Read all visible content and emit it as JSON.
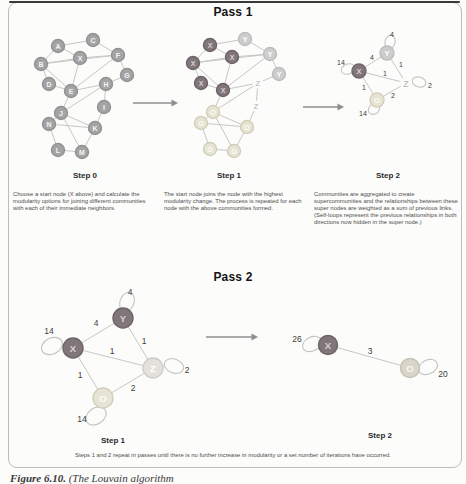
{
  "page": {
    "pass1_title": "Pass 1",
    "pass2_title": "Pass 2",
    "step_labels": {
      "p1s0": "Step 0",
      "p1s1": "Step 1",
      "p1s2": "Step 2",
      "p2s1": "Step 1",
      "p2s2": "Step 2"
    },
    "captions": {
      "step0": "Choose a start node (X above) and calculate the modularity options for joining different communities with each of their immediate neighbors.",
      "step1": "The start node joins the node with the highest modularity change. The process is repeated for each node with the above communities formed.",
      "step2": "Communities are aggregated to create supercommunities and the relationships between these super nodes are weighted as a sum of previous links. (Self-loops represent the previous relationships in both directions now hidden in the super node.)",
      "bottom": "Steps 1 and 2 repeat in passes until there is no further increase in modularity or a set number of iterations have occurred."
    },
    "figure_caption_prefix": "Figure 6.10.",
    "figure_caption_rest": " (The Louvain algorithm"
  },
  "palette": {
    "edge": "#c7c7c7",
    "loop": "#c3c3c3",
    "arrow": "#8f8f8f",
    "weight_text": "#3c3c3c",
    "types": {
      "g": {
        "fill": "#a4a4a4",
        "stroke": "#929292",
        "text": "#f5f5f5"
      },
      "x": {
        "fill": "#81777a",
        "stroke": "#6d6366",
        "text": "#d8d1d3"
      },
      "y": {
        "fill": "#cdcdcd",
        "stroke": "#bdbdbd",
        "text": "#ffffff"
      },
      "o": {
        "fill": "#e6e4d4",
        "stroke": "#d2cfb8",
        "text": "#fdfdf6"
      },
      "zn": {
        "fill": "#e2e1dc",
        "stroke": "#cecdc5",
        "text": "#ffffff"
      },
      "oz": {
        "fill": "#d9d5ca",
        "stroke": "#c5c1b3",
        "text": "#f8f7f1"
      },
      "zt": {
        "circle": false,
        "text": "#b3b3b3"
      }
    }
  },
  "graphs": [
    {
      "id": "pass1-step0",
      "r": 6.5,
      "nfs": 7,
      "lfs": 7,
      "nodes": [
        {
          "id": "A",
          "x": 58,
          "y": 46,
          "t": "g",
          "l": "A"
        },
        {
          "id": "C",
          "x": 93,
          "y": 40,
          "t": "g",
          "l": "C"
        },
        {
          "id": "F",
          "x": 118,
          "y": 55,
          "t": "g",
          "l": "F"
        },
        {
          "id": "B",
          "x": 41,
          "y": 64,
          "t": "g",
          "l": "B"
        },
        {
          "id": "X",
          "x": 80,
          "y": 58,
          "t": "g",
          "l": "X"
        },
        {
          "id": "G",
          "x": 127,
          "y": 75,
          "t": "g",
          "l": "G"
        },
        {
          "id": "D",
          "x": 49,
          "y": 84,
          "t": "g",
          "l": "D"
        },
        {
          "id": "E",
          "x": 71,
          "y": 91,
          "t": "g",
          "l": "E"
        },
        {
          "id": "H",
          "x": 106,
          "y": 84,
          "t": "g",
          "l": "H"
        },
        {
          "id": "I",
          "x": 104,
          "y": 107,
          "t": "g",
          "l": "I"
        },
        {
          "id": "J",
          "x": 61,
          "y": 113,
          "t": "g",
          "l": "J"
        },
        {
          "id": "N",
          "x": 49,
          "y": 124,
          "t": "g",
          "l": "N"
        },
        {
          "id": "K",
          "x": 95,
          "y": 128,
          "t": "g",
          "l": "K"
        },
        {
          "id": "L",
          "x": 58,
          "y": 150,
          "t": "g",
          "l": "L"
        },
        {
          "id": "M",
          "x": 82,
          "y": 152,
          "t": "g",
          "l": "M"
        }
      ],
      "edges": [
        [
          "A",
          "B"
        ],
        [
          "A",
          "X"
        ],
        [
          "A",
          "C"
        ],
        [
          "B",
          "X"
        ],
        [
          "B",
          "D"
        ],
        [
          "B",
          "E"
        ],
        [
          "B",
          "F"
        ],
        [
          "C",
          "F"
        ],
        [
          "D",
          "E"
        ],
        [
          "E",
          "X"
        ],
        [
          "E",
          "F"
        ],
        [
          "E",
          "H"
        ],
        [
          "E",
          "J"
        ],
        [
          "X",
          "F"
        ],
        [
          "F",
          "G"
        ],
        [
          "G",
          "H"
        ],
        [
          "H",
          "I"
        ],
        [
          "H",
          "J"
        ],
        [
          "I",
          "K"
        ],
        [
          "J",
          "K"
        ],
        [
          "J",
          "N"
        ],
        [
          "J",
          "M"
        ],
        [
          "N",
          "K"
        ],
        [
          "N",
          "L"
        ],
        [
          "K",
          "M"
        ],
        [
          "L",
          "M"
        ]
      ],
      "loops": [],
      "labels": []
    },
    {
      "id": "pass1-step1",
      "r": 6.5,
      "nfs": 7,
      "lfs": 7,
      "nodes": [
        {
          "id": "A",
          "x": 210,
          "y": 45,
          "t": "x",
          "l": "X"
        },
        {
          "id": "C",
          "x": 245,
          "y": 39,
          "t": "y",
          "l": "Y"
        },
        {
          "id": "F",
          "x": 270,
          "y": 54,
          "t": "y",
          "l": "Y"
        },
        {
          "id": "B",
          "x": 193,
          "y": 63,
          "t": "x",
          "l": "X"
        },
        {
          "id": "X",
          "x": 232,
          "y": 57,
          "t": "x",
          "l": "X"
        },
        {
          "id": "G",
          "x": 279,
          "y": 74,
          "t": "y",
          "l": "Y"
        },
        {
          "id": "D",
          "x": 201,
          "y": 83,
          "t": "x",
          "l": "X"
        },
        {
          "id": "E",
          "x": 223,
          "y": 90,
          "t": "x",
          "l": "X"
        },
        {
          "id": "H",
          "x": 258,
          "y": 83,
          "t": "zt",
          "l": "Z",
          "fs": 8
        },
        {
          "id": "I",
          "x": 256,
          "y": 106,
          "t": "zt",
          "l": "Z",
          "fs": 8
        },
        {
          "id": "J",
          "x": 213,
          "y": 112,
          "t": "o",
          "l": "O"
        },
        {
          "id": "N",
          "x": 201,
          "y": 123,
          "t": "o",
          "l": "O"
        },
        {
          "id": "K",
          "x": 247,
          "y": 127,
          "t": "o",
          "l": "O"
        },
        {
          "id": "L",
          "x": 210,
          "y": 149,
          "t": "o",
          "l": "O"
        },
        {
          "id": "M",
          "x": 234,
          "y": 151,
          "t": "o",
          "l": "O"
        }
      ],
      "edges": [
        [
          "A",
          "B"
        ],
        [
          "A",
          "X"
        ],
        [
          "A",
          "C"
        ],
        [
          "B",
          "X"
        ],
        [
          "B",
          "D"
        ],
        [
          "B",
          "E"
        ],
        [
          "B",
          "F"
        ],
        [
          "C",
          "F"
        ],
        [
          "D",
          "E"
        ],
        [
          "E",
          "X"
        ],
        [
          "E",
          "F"
        ],
        [
          "E",
          "H"
        ],
        [
          "E",
          "J"
        ],
        [
          "X",
          "F"
        ],
        [
          "F",
          "G"
        ],
        [
          "G",
          "H"
        ],
        [
          "H",
          "I"
        ],
        [
          "H",
          "J"
        ],
        [
          "I",
          "K"
        ],
        [
          "J",
          "K"
        ],
        [
          "J",
          "N"
        ],
        [
          "J",
          "M"
        ],
        [
          "N",
          "K"
        ],
        [
          "N",
          "L"
        ],
        [
          "K",
          "M"
        ],
        [
          "L",
          "M"
        ]
      ],
      "loops": [],
      "labels": []
    },
    {
      "id": "pass1-step2",
      "r": 7,
      "nfs": 7.5,
      "lfs": 7,
      "nodes": [
        {
          "id": "Y",
          "x": 387,
          "y": 53,
          "t": "y",
          "l": "Y"
        },
        {
          "id": "X",
          "x": 359,
          "y": 71,
          "t": "x",
          "l": "X"
        },
        {
          "id": "Z",
          "x": 406,
          "y": 83,
          "t": "zt",
          "l": "Z",
          "fs": 9
        },
        {
          "id": "O",
          "x": 377,
          "y": 100,
          "t": "o",
          "l": "O"
        }
      ],
      "edges": [
        [
          "X",
          "Y"
        ],
        [
          "Y",
          "Z"
        ],
        [
          "X",
          "Z"
        ],
        [
          "X",
          "O"
        ],
        [
          "O",
          "Z"
        ]
      ],
      "loops": [
        {
          "cx": 390,
          "cy": 42,
          "rx": 5,
          "ry": 7,
          "rot": 15
        },
        {
          "cx": 348,
          "cy": 69,
          "rx": 7,
          "ry": 5,
          "rot": -20
        },
        {
          "cx": 419,
          "cy": 82,
          "rx": 7,
          "ry": 5,
          "rot": 15
        },
        {
          "cx": 374,
          "cy": 109,
          "rx": 6,
          "ry": 5,
          "rot": -35
        }
      ],
      "labels": [
        {
          "t": "4",
          "x": 392,
          "y": 34
        },
        {
          "t": "14",
          "x": 341,
          "y": 62
        },
        {
          "t": "2",
          "x": 430,
          "y": 85
        },
        {
          "t": "14",
          "x": 363,
          "y": 113
        },
        {
          "t": "4",
          "x": 372,
          "y": 57
        },
        {
          "t": "1",
          "x": 401,
          "y": 64
        },
        {
          "t": "1",
          "x": 385,
          "y": 73
        },
        {
          "t": "1",
          "x": 364,
          "y": 87
        },
        {
          "t": "2",
          "x": 393,
          "y": 95
        }
      ]
    },
    {
      "id": "pass2-step1",
      "r": 10,
      "nfs": 9.5,
      "lfs": 8.5,
      "nodes": [
        {
          "id": "Y",
          "x": 123,
          "y": 318,
          "t": "x",
          "l": "Y"
        },
        {
          "id": "X",
          "x": 73,
          "y": 348,
          "t": "x",
          "l": "X"
        },
        {
          "id": "Z",
          "x": 153,
          "y": 368,
          "t": "zn",
          "l": "Z"
        },
        {
          "id": "O",
          "x": 103,
          "y": 398,
          "t": "o",
          "l": "O"
        }
      ],
      "edges": [
        [
          "X",
          "Y"
        ],
        [
          "Y",
          "Z"
        ],
        [
          "X",
          "Z"
        ],
        [
          "X",
          "O"
        ],
        [
          "O",
          "Z"
        ]
      ],
      "loops": [
        {
          "cx": 127,
          "cy": 302,
          "rx": 7,
          "ry": 10,
          "rot": 20
        },
        {
          "cx": 52,
          "cy": 346,
          "rx": 11,
          "ry": 8,
          "rot": -25
        },
        {
          "cx": 174,
          "cy": 366,
          "rx": 10,
          "ry": 7,
          "rot": 20
        },
        {
          "cx": 96,
          "cy": 416,
          "rx": 11,
          "ry": 8,
          "rot": -35
        }
      ],
      "labels": [
        {
          "t": "4",
          "x": 130,
          "y": 292
        },
        {
          "t": "14",
          "x": 49,
          "y": 331
        },
        {
          "t": "2",
          "x": 187,
          "y": 370
        },
        {
          "t": "14",
          "x": 82,
          "y": 419
        },
        {
          "t": "4",
          "x": 96,
          "y": 323
        },
        {
          "t": "1",
          "x": 144,
          "y": 341
        },
        {
          "t": "1",
          "x": 112,
          "y": 351
        },
        {
          "t": "1",
          "x": 80,
          "y": 375
        },
        {
          "t": "2",
          "x": 133,
          "y": 388
        }
      ]
    },
    {
      "id": "pass2-step2",
      "r": 9.5,
      "nfs": 9.5,
      "lfs": 8.5,
      "nodes": [
        {
          "id": "X",
          "x": 328,
          "y": 345,
          "t": "x",
          "l": "X"
        },
        {
          "id": "O",
          "x": 410,
          "y": 368,
          "t": "oz",
          "l": "O"
        }
      ],
      "edges": [
        [
          "X",
          "O"
        ]
      ],
      "loops": [
        {
          "cx": 312,
          "cy": 344,
          "rx": 10,
          "ry": 7,
          "rot": -25
        },
        {
          "cx": 428,
          "cy": 367,
          "rx": 10,
          "ry": 7,
          "rot": -25
        }
      ],
      "labels": [
        {
          "t": "26",
          "x": 297,
          "y": 339
        },
        {
          "t": "20",
          "x": 443,
          "y": 374
        },
        {
          "t": "3",
          "x": 370,
          "y": 351
        }
      ]
    }
  ],
  "arrows": [
    {
      "x1": 133,
      "y1": 103,
      "x2": 178,
      "y2": 103
    },
    {
      "x1": 303,
      "y1": 107,
      "x2": 344,
      "y2": 107
    },
    {
      "x1": 206,
      "y1": 337,
      "x2": 258,
      "y2": 337
    }
  ]
}
